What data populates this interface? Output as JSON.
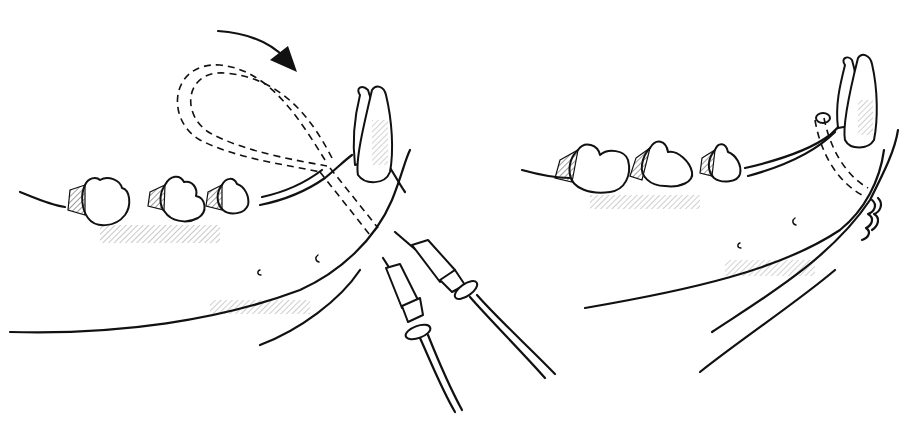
{
  "figure": {
    "type": "line-art medical illustration",
    "background": "#ffffff",
    "ink": "#111111",
    "panels": [
      {
        "id": "left",
        "description": "Wire loop passed around canine tooth with two needle/catheter ends; arrow indicates rotation direction",
        "elements": [
          "rotation-arrow",
          "dashed-wire-loop",
          "canine-tooth",
          "premolar-teeth",
          "mandible-outline",
          "two-needles-with-wires",
          "mental-foramina"
        ]
      },
      {
        "id": "right",
        "description": "Wire tightened around canine tooth and twisted at the ventral mandible",
        "elements": [
          "canine-tooth",
          "premolar-teeth",
          "dashed-wire-around-mandible",
          "twisted-wire-knot",
          "mandible-outline",
          "mental-foramina"
        ]
      }
    ]
  }
}
